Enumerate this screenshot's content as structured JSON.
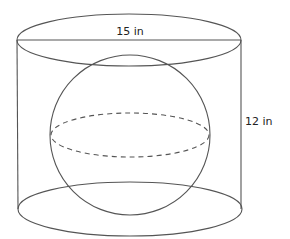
{
  "diagram": {
    "labels": {
      "diameter": "15 in",
      "height": "12 in"
    },
    "colors": {
      "stroke": "#555555",
      "text": "#222222",
      "background": "#ffffff"
    },
    "shapes": {
      "cylinder": {
        "diameter_label": "15 in",
        "height_label": "12 in"
      },
      "sphere": {
        "equator": "dashed"
      }
    }
  }
}
